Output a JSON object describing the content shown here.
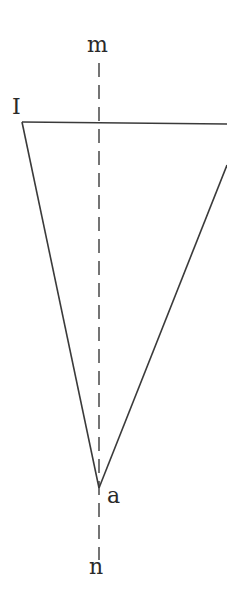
{
  "diagram": {
    "type": "geometry",
    "stroke_color": "#3a3a3a",
    "background": "#ffffff",
    "labels": {
      "m": "m",
      "n": "n",
      "I": "I",
      "a": "a"
    },
    "points": {
      "I": [
        22,
        122
      ],
      "a": [
        99,
        488
      ],
      "top_right": [
        227,
        124
      ],
      "right_edge": [
        227,
        165
      ],
      "m_line_top": [
        99,
        63
      ],
      "n_line_bottom": [
        99,
        560
      ]
    },
    "lines": [
      {
        "name": "top-edge",
        "from": "I",
        "to": "top_right",
        "style": "solid"
      },
      {
        "name": "left-edge",
        "from": "I",
        "to": "a",
        "style": "solid"
      },
      {
        "name": "right-edge",
        "from": "a",
        "to": "right_edge",
        "style": "solid"
      },
      {
        "name": "axis-mn",
        "from": "m_line_top",
        "to": "n_line_bottom",
        "style": "dashed"
      }
    ]
  }
}
